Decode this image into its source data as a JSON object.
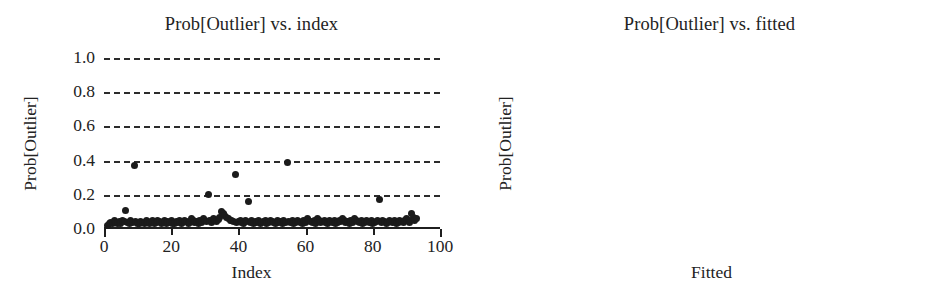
{
  "figure": {
    "background_color": "#ffffff",
    "marker_color": "#1b1b1b",
    "grid_color": "#2b2b2b",
    "axis_color": "#1f1f1f"
  },
  "chart_data": [
    {
      "type": "scatter",
      "panel": "left",
      "title": "Prob[Outlier] vs. index",
      "xlabel": "Index",
      "ylabel": "Prob[Outlier]",
      "xlim": [
        0,
        100
      ],
      "ylim": [
        0.0,
        1.0
      ],
      "xticks": [
        0,
        20,
        40,
        60,
        80,
        100
      ],
      "xtick_labels": [
        "0",
        "20",
        "40",
        "60",
        "80",
        "100"
      ],
      "yticks": [
        0.0,
        0.2,
        0.4,
        0.6,
        0.8,
        1.0
      ],
      "ytick_labels": [
        "0.0",
        "0.2",
        "0.4",
        "0.6",
        "0.8",
        "1.0"
      ],
      "ytick_label_position": "outside-left",
      "grid": "horizontal-dashed",
      "legend": "none",
      "x": [
        1,
        1.5,
        2,
        2.5,
        3,
        3.5,
        4,
        4.5,
        5,
        5.5,
        6,
        6.5,
        7,
        7.5,
        8,
        8.5,
        9,
        9.5,
        10,
        10.5,
        11,
        11.5,
        12,
        12.5,
        13,
        13.5,
        14,
        14.5,
        15,
        15.5,
        16,
        16.5,
        17,
        17.5,
        18,
        18.5,
        19,
        19.5,
        20,
        20.5,
        21,
        21.5,
        22,
        22.5,
        23,
        23.5,
        24,
        24.5,
        25,
        25.5,
        26,
        26.5,
        27,
        27.5,
        28,
        28.5,
        29,
        29.5,
        30,
        30.5,
        31,
        31.5,
        32,
        32.5,
        33,
        33.5,
        34,
        34.5,
        35,
        35.5,
        36,
        36.5,
        37,
        37.5,
        38,
        38.5,
        39,
        39.5,
        40,
        40.5,
        41,
        41.5,
        42,
        42.5,
        43,
        43.5,
        44,
        44.5,
        45,
        45.5,
        46,
        46.5,
        47,
        47.5,
        48,
        48.5,
        49,
        49.5,
        50,
        50.5,
        51,
        51.5,
        52,
        52.5,
        53,
        53.5,
        54,
        54.5,
        55,
        55.5,
        56,
        56.5,
        57,
        57.5,
        58,
        58.5,
        59,
        59.5,
        60,
        60.5,
        61,
        61.5,
        62,
        62.5,
        63,
        63.5,
        64,
        64.5,
        65,
        65.5,
        66,
        66.5,
        67,
        67.5,
        68,
        68.5,
        69,
        69.5,
        70,
        70.5,
        71,
        71.5,
        72,
        72.5,
        73,
        73.5,
        74,
        74.5,
        75,
        75.5,
        76,
        76.5,
        77,
        77.5,
        78,
        78.5,
        79,
        79.5,
        80,
        80.5,
        81,
        81.5,
        82,
        82.5,
        83,
        83.5,
        84,
        84.5,
        85,
        85.5,
        86,
        86.5,
        87,
        87.5,
        88,
        88.5,
        89,
        89.5,
        90,
        90.5,
        91,
        91.5,
        92,
        92.5,
        93,
        93.5,
        94,
        94.5,
        95
      ],
      "y": [
        0.02,
        0.035,
        0.04,
        0.03,
        0.05,
        0.04,
        0.035,
        0.045,
        0.03,
        0.05,
        0.045,
        0.11,
        0.04,
        0.035,
        0.05,
        0.04,
        0.37,
        0.045,
        0.035,
        0.03,
        0.045,
        0.04,
        0.035,
        0.05,
        0.04,
        0.03,
        0.045,
        0.05,
        0.035,
        0.04,
        0.05,
        0.045,
        0.03,
        0.04,
        0.05,
        0.035,
        0.045,
        0.04,
        0.05,
        0.035,
        0.03,
        0.045,
        0.04,
        0.05,
        0.035,
        0.04,
        0.05,
        0.045,
        0.035,
        0.04,
        0.06,
        0.05,
        0.04,
        0.045,
        0.035,
        0.05,
        0.04,
        0.06,
        0.05,
        0.045,
        0.2,
        0.05,
        0.04,
        0.06,
        0.05,
        0.045,
        0.055,
        0.07,
        0.1,
        0.09,
        0.08,
        0.07,
        0.06,
        0.05,
        0.05,
        0.045,
        0.32,
        0.04,
        0.045,
        0.05,
        0.04,
        0.035,
        0.05,
        0.045,
        0.16,
        0.04,
        0.05,
        0.035,
        0.045,
        0.04,
        0.05,
        0.035,
        0.04,
        0.045,
        0.05,
        0.035,
        0.04,
        0.05,
        0.045,
        0.04,
        0.035,
        0.05,
        0.04,
        0.045,
        0.035,
        0.05,
        0.04,
        0.39,
        0.045,
        0.04,
        0.05,
        0.035,
        0.04,
        0.05,
        0.045,
        0.04,
        0.035,
        0.05,
        0.04,
        0.06,
        0.05,
        0.045,
        0.04,
        0.05,
        0.035,
        0.06,
        0.05,
        0.04,
        0.045,
        0.05,
        0.04,
        0.035,
        0.05,
        0.045,
        0.04,
        0.05,
        0.035,
        0.04,
        0.05,
        0.045,
        0.06,
        0.05,
        0.04,
        0.045,
        0.035,
        0.05,
        0.04,
        0.06,
        0.05,
        0.045,
        0.04,
        0.05,
        0.035,
        0.04,
        0.05,
        0.045,
        0.04,
        0.05,
        0.035,
        0.04,
        0.045,
        0.05,
        0.17,
        0.04,
        0.05,
        0.045,
        0.035,
        0.04,
        0.05,
        0.045,
        0.04,
        0.05,
        0.035,
        0.04,
        0.05,
        0.045,
        0.04,
        0.05,
        0.06,
        0.05,
        0.04,
        0.09,
        0.07,
        0.05,
        0.06
      ]
    },
    {
      "type": "scatter",
      "panel": "right",
      "title": "Prob[Outlier] vs. fitted",
      "xlabel": "Fitted",
      "ylabel": "Prob[Outlier]",
      "xlim": [
        -0.1,
        0.15
      ],
      "ylim": [
        0.0,
        1.0
      ],
      "xticks": [
        -0.1,
        -0.05,
        0.0,
        0.05,
        0.1,
        0.15
      ],
      "xtick_labels": [
        "−0.10",
        "−0.05",
        "0.00",
        "0.05",
        "0.10",
        "0.15"
      ],
      "yticks": [
        0.0,
        0.2,
        0.4,
        0.6,
        0.8,
        1.0
      ],
      "ytick_labels": [
        "0.0",
        "0.2",
        "0.4",
        "0.6",
        "0.8",
        "1.0"
      ],
      "ytick_label_position": "inside-center",
      "grid": "horizontal-dashed",
      "legend": "none",
      "x": [
        -0.062,
        -0.055,
        -0.052,
        -0.05,
        -0.048,
        -0.046,
        -0.044,
        -0.042,
        -0.041,
        -0.04,
        -0.039,
        -0.038,
        -0.037,
        -0.036,
        -0.035,
        -0.034,
        -0.033,
        -0.032,
        -0.031,
        -0.03,
        -0.029,
        -0.028,
        -0.027,
        -0.026,
        -0.025,
        -0.024,
        -0.023,
        -0.022,
        -0.021,
        -0.02,
        -0.019,
        -0.018,
        -0.017,
        -0.016,
        -0.015,
        -0.014,
        -0.013,
        -0.012,
        -0.011,
        -0.01,
        -0.009,
        -0.008,
        -0.007,
        -0.006,
        -0.005,
        -0.004,
        -0.003,
        -0.002,
        -0.001,
        0.0,
        0.001,
        0.002,
        0.003,
        0.004,
        0.005,
        0.006,
        0.007,
        0.008,
        0.009,
        0.01,
        0.011,
        0.012,
        0.013,
        0.014,
        0.015,
        0.016,
        0.018,
        0.02,
        0.022,
        0.024,
        0.026,
        0.028,
        0.03,
        0.032,
        0.034,
        0.036,
        0.038,
        0.04,
        0.042,
        0.044,
        0.046,
        0.048,
        0.05,
        0.051,
        0.052,
        0.054,
        0.056,
        0.058,
        0.06,
        0.062,
        0.064,
        0.066,
        0.068,
        0.07,
        0.072,
        0.074,
        0.076,
        0.078,
        0.08,
        0.082,
        0.084,
        0.086,
        0.088,
        0.09,
        0.092,
        0.094,
        0.096,
        0.098,
        0.1,
        0.102,
        0.104,
        0.105,
        0.106,
        0.108,
        0.11,
        0.111,
        0.112,
        0.114,
        0.116,
        0.118,
        0.12,
        0.122,
        0.124,
        0.126,
        0.128,
        0.132,
        0.136
      ],
      "y": [
        0.39,
        0.03,
        0.045,
        0.05,
        0.04,
        0.06,
        0.05,
        0.17,
        0.04,
        0.05,
        0.06,
        0.045,
        0.05,
        0.04,
        0.06,
        0.05,
        0.07,
        0.05,
        0.04,
        0.05,
        0.06,
        0.05,
        0.04,
        0.05,
        0.045,
        0.04,
        0.05,
        0.06,
        0.05,
        0.09,
        0.06,
        0.05,
        0.04,
        0.05,
        0.06,
        0.05,
        0.04,
        0.05,
        0.045,
        0.05,
        0.04,
        0.05,
        0.06,
        0.05,
        0.04,
        0.05,
        0.06,
        0.05,
        0.07,
        0.09,
        0.06,
        0.05,
        0.04,
        0.05,
        0.37,
        0.35,
        0.34,
        0.33,
        0.05,
        0.04,
        0.05,
        0.06,
        0.05,
        0.04,
        0.05,
        0.06,
        0.08,
        0.05,
        0.04,
        0.03,
        0.04,
        0.05,
        0.04,
        0.03,
        0.04,
        0.05,
        0.06,
        0.05,
        0.07,
        0.06,
        0.05,
        0.04,
        0.12,
        0.1,
        0.06,
        0.05,
        0.04,
        0.05,
        0.08,
        0.06,
        0.05,
        0.04,
        0.05,
        0.06,
        0.05,
        0.04,
        0.05,
        0.06,
        0.05,
        0.04,
        0.05,
        0.12,
        0.06,
        0.05,
        0.04,
        0.05,
        0.06,
        0.05,
        0.04,
        0.06,
        0.18,
        0.19,
        0.18,
        0.05,
        0.17,
        0.18,
        0.06,
        0.05,
        0.04,
        0.05,
        0.06,
        0.05,
        0.04,
        0.05,
        0.04,
        0.05,
        0.04
      ]
    }
  ]
}
